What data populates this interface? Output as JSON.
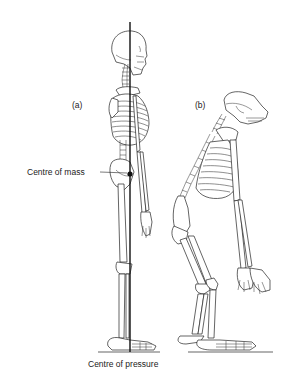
{
  "figure": {
    "panel_a_label": "(a)",
    "panel_b_label": "(b)",
    "panel_a_subject": "human skeleton (upright, side view)",
    "panel_b_subject": "chimpanzee skeleton (knuckle-walking, side view)"
  },
  "annotations": {
    "centre_of_mass": "Centre of mass",
    "centre_of_pressure": "Centre of pressure"
  },
  "colors": {
    "line": "#111111",
    "background": "#ffffff"
  }
}
